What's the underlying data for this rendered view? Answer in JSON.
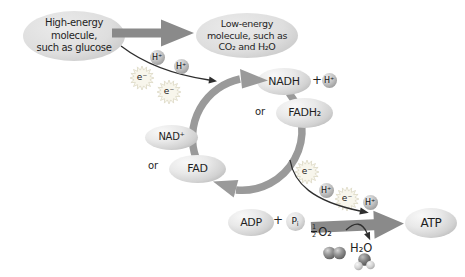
{
  "nodes": {
    "high_energy": "High-energy\nmolecule,\nsuch as glucose",
    "low_energy": "Low-energy\nmolecule, such as\nCO₂ and H₂O",
    "nadh": "NADH",
    "fadh2": "FADH₂",
    "nad_plus": "NAD⁺",
    "fad": "FAD",
    "adp": "ADP",
    "atp": "ATP"
  },
  "particles": {
    "proton": "H⁺",
    "electron": "e⁻",
    "phosphate": {
      "base": "P",
      "sub": "i"
    }
  },
  "labels": {
    "or": "or",
    "plus": "+",
    "oxygen": {
      "num": "1",
      "den": "2",
      "formula": "O₂"
    },
    "water": "H₂O"
  },
  "colors": {
    "background": "#ffffff",
    "big_arrow": "#8a8a8a",
    "cycle_arrow": "#9a9a9a",
    "thin_arrow": "#2e2e2e",
    "node_fill": "#e9e9e9",
    "node_shade": "#a8a8a8",
    "burst_fill": "#f8f6ec",
    "text": "#1f1f1f"
  }
}
